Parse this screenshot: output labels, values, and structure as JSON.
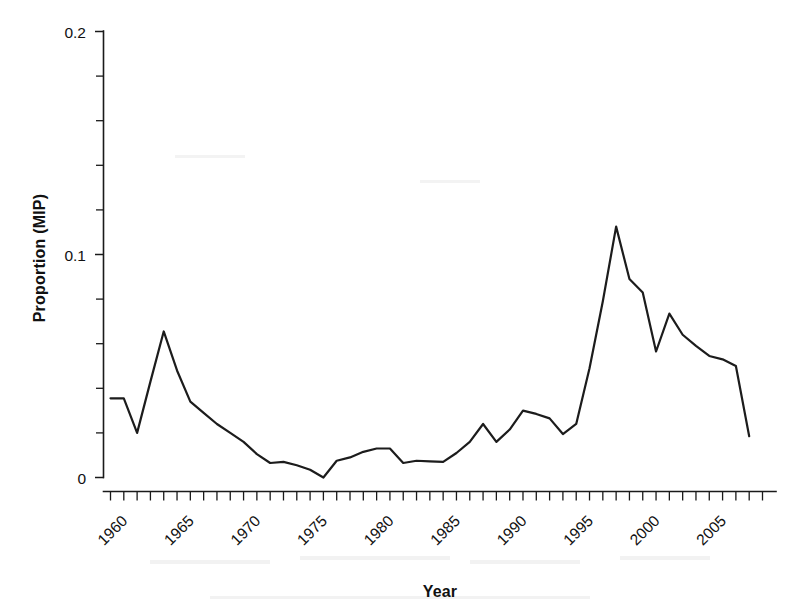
{
  "chart_data": {
    "type": "line",
    "title": "",
    "xlabel": "Year",
    "ylabel": "Proportion (MIP)",
    "xlim": [
      1959.3,
      2009.5
    ],
    "ylim": [
      0,
      0.2
    ],
    "grid": false,
    "legend": null,
    "x_tick_labels": [
      "1960",
      "1965",
      "1970",
      "1975",
      "1980",
      "1985",
      "1990",
      "1995",
      "2000",
      "2005"
    ],
    "x_tick_values": [
      1960,
      1965,
      1970,
      1975,
      1980,
      1985,
      1990,
      1995,
      2000,
      2005
    ],
    "x_minor_tick_step": 1,
    "y_tick_labels": [
      "0",
      "0.1",
      "0.2"
    ],
    "y_tick_values": [
      0,
      0.1,
      0.2
    ],
    "y_minor_tick_values": [
      0.02,
      0.04,
      0.06,
      0.08,
      0.12,
      0.14,
      0.16,
      0.18
    ],
    "x_tick_label_rotation": -45,
    "line_color": "#1c1c1c",
    "series": [
      {
        "name": "Proportion (MIP)",
        "x": [
          1960,
          1961,
          1962,
          1963,
          1964,
          1965,
          1966,
          1967,
          1968,
          1969,
          1970,
          1971,
          1972,
          1973,
          1974,
          1975,
          1976,
          1977,
          1978,
          1979,
          1980,
          1981,
          1982,
          1983,
          1984,
          1985,
          1986,
          1987,
          1988,
          1989,
          1990,
          1991,
          1992,
          1993,
          1994,
          1995,
          1996,
          1997,
          1998,
          1999,
          2000,
          2001,
          2002,
          2003,
          2004,
          2005,
          2006,
          2007,
          2008
        ],
        "values": [
          0.0355,
          0.0355,
          0.02,
          0.043,
          0.0655,
          0.048,
          0.034,
          0.029,
          0.024,
          0.02,
          0.016,
          0.0105,
          0.0065,
          0.007,
          0.0055,
          0.0035,
          0.0,
          0.0075,
          0.009,
          0.0115,
          0.013,
          0.013,
          0.0065,
          0.0075,
          0.0072,
          0.007,
          0.011,
          0.016,
          0.024,
          0.016,
          0.0215,
          0.03,
          0.0285,
          0.0265,
          0.0195,
          0.024,
          0.049,
          0.079,
          0.1125,
          0.089,
          0.083,
          0.0565,
          0.0735,
          0.064,
          0.059,
          0.0545,
          0.053,
          0.05,
          0.0185
        ]
      }
    ]
  },
  "axis": {
    "y_label": "Proportion (MIP)",
    "x_label": "Year"
  }
}
